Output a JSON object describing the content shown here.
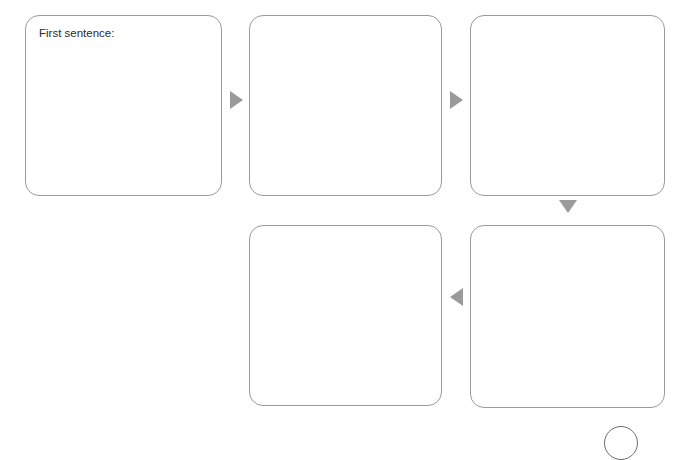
{
  "page": {
    "background_color": "#ffffff",
    "width": 688,
    "height": 441
  },
  "style": {
    "panel_border_color": "#9a9a9a",
    "arrow_color": "#9a9a9a",
    "text_color": "#2b2b2b",
    "circle_color": "#6b6b6b"
  },
  "storyboard": {
    "panels": [
      {
        "id": "panel-1",
        "label": "First sentence:",
        "x": 25,
        "y": 15,
        "width": 197,
        "height": 181
      },
      {
        "id": "panel-2",
        "label": "",
        "x": 249,
        "y": 15,
        "width": 193,
        "height": 181
      },
      {
        "id": "panel-3",
        "label": "",
        "x": 470,
        "y": 15,
        "width": 195,
        "height": 181
      },
      {
        "id": "panel-4",
        "label": "",
        "x": 249,
        "y": 225,
        "width": 193,
        "height": 181
      },
      {
        "id": "panel-5",
        "label": "",
        "x": 470,
        "y": 225,
        "width": 195,
        "height": 183
      }
    ],
    "connectors": [
      {
        "id": "connector-1-to-2",
        "direction": "right",
        "x": 230,
        "y": 91
      },
      {
        "id": "connector-2-to-3",
        "direction": "right",
        "x": 450,
        "y": 91
      },
      {
        "id": "connector-3-to-5",
        "direction": "down",
        "x": 559,
        "y": 200
      },
      {
        "id": "connector-5-to-4",
        "direction": "left",
        "x": 450,
        "y": 288
      }
    ],
    "marks": [
      {
        "id": "circle-mark",
        "x": 604,
        "y": 426,
        "size": 34
      }
    ]
  }
}
